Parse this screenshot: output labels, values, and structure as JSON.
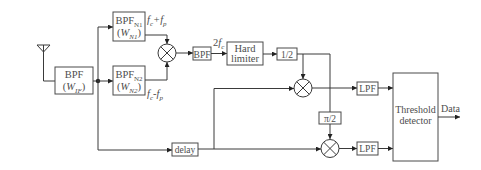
{
  "diagram": {
    "colors": {
      "line": "#3a3a3a",
      "text": "#4d4d4d",
      "background": "#ffffff"
    },
    "antenna": {
      "icon": "antenna-icon"
    },
    "blocks": {
      "bpf_if": {
        "name": "BPF",
        "open": "(",
        "var": "W",
        "sub": "IF",
        "close": ")"
      },
      "bpf_n1": {
        "name": "BPF",
        "name_sub": "N1",
        "open": "(",
        "var": "W",
        "sub": "N1",
        "close": ")"
      },
      "bpf_n2": {
        "name": "BPF",
        "name_sub": "N2",
        "open": "(",
        "var": "W",
        "sub": "N2",
        "close": ")"
      },
      "bpf_2fc": {
        "name": "BPF"
      },
      "hard_limiter": {
        "line1": "Hard",
        "line2": "limiter"
      },
      "half": {
        "name": "1/2"
      },
      "phase_shift": {
        "name": "π/2"
      },
      "lpf_i": {
        "name": "LPF"
      },
      "lpf_q": {
        "name": "LPF"
      },
      "delay": {
        "name": "delay"
      },
      "threshold_detector": {
        "line1": "Threshold",
        "line2": "detector"
      }
    },
    "labels": {
      "sum_freq": {
        "f1": "f",
        "s1": "c",
        "op": "+",
        "f2": "f",
        "s2": "p"
      },
      "diff_freq": {
        "f1": "f",
        "s1": "c",
        "op": "-",
        "f2": "f",
        "s2": "p"
      },
      "double_freq": {
        "coef": "2",
        "f": "f",
        "s": "c"
      },
      "output": "Data"
    },
    "multipliers": [
      {
        "id": "mixer-1",
        "symbol": "⊗"
      },
      {
        "id": "mixer-2",
        "symbol": "⊗"
      },
      {
        "id": "mixer-3",
        "symbol": "⊗"
      }
    ],
    "connections": [
      [
        "antenna",
        "bpf_if"
      ],
      [
        "bpf_if",
        "bpf_n1"
      ],
      [
        "bpf_if",
        "bpf_n2"
      ],
      [
        "bpf_if",
        "delay"
      ],
      [
        "bpf_n1",
        "mixer-1"
      ],
      [
        "bpf_n2",
        "mixer-1"
      ],
      [
        "mixer-1",
        "bpf_2fc"
      ],
      [
        "bpf_2fc",
        "hard_limiter"
      ],
      [
        "hard_limiter",
        "half"
      ],
      [
        "half",
        "mixer-2"
      ],
      [
        "half",
        "phase_shift"
      ],
      [
        "delay",
        "mixer-2"
      ],
      [
        "delay",
        "mixer-3"
      ],
      [
        "phase_shift",
        "mixer-3"
      ],
      [
        "mixer-2",
        "lpf_i"
      ],
      [
        "mixer-3",
        "lpf_q"
      ],
      [
        "lpf_i",
        "threshold_detector"
      ],
      [
        "lpf_q",
        "threshold_detector"
      ],
      [
        "threshold_detector",
        "output"
      ]
    ]
  }
}
